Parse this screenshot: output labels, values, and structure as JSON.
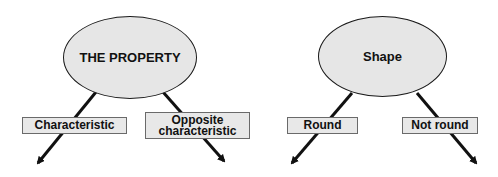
{
  "diagrams": [
    {
      "root": "THE PROPERTY",
      "branches": [
        "Characteristic",
        "Opposite characteristic"
      ]
    },
    {
      "root": "Shape",
      "branches": [
        "Round",
        "Not round"
      ]
    }
  ],
  "colors": {
    "ellipse_fill": "#e6e6e6",
    "box_fill": "#e8e8e8",
    "stroke": "#111111"
  }
}
